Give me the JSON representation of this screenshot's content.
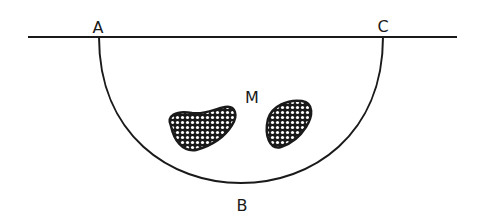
{
  "diagram": {
    "type": "semicircular region below a line with two shaded inclusions",
    "labels": {
      "a": "A",
      "b": "B",
      "c": "C",
      "m": "M"
    },
    "colors": {
      "ink": "#1a1a1a",
      "background": "#ffffff",
      "hatch_fill": "#ffffff"
    }
  }
}
